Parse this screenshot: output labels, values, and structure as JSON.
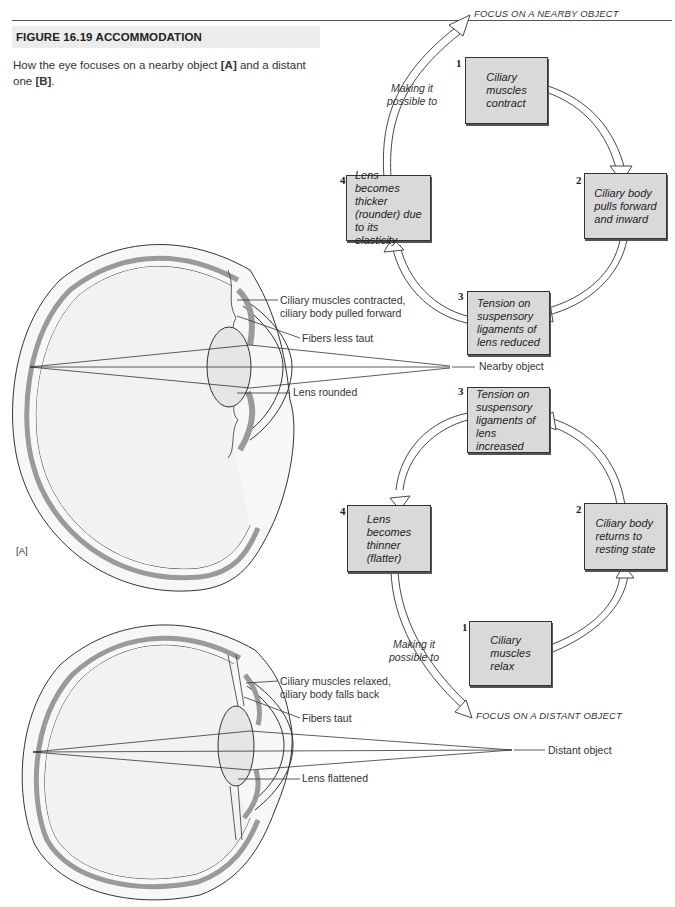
{
  "header": {
    "title": "FIGURE 16.19  ACCOMMODATION",
    "caption_pre": "How the eye focuses on a nearby object ",
    "caption_a": "[A]",
    "caption_mid": " and a distant one ",
    "caption_b": "[B]",
    "caption_post": "."
  },
  "panel_a": {
    "label": "[A]",
    "eye_labels": {
      "ciliary": "Ciliary muscles contracted,\n    ciliary body pulled forward",
      "fibers": "Fibers less taut",
      "lens": "Lens rounded",
      "object": "Nearby object"
    },
    "cycle": {
      "focus_label": "FOCUS ON A NEARBY OBJECT",
      "arrow_label": "Making it\npossible to",
      "steps": [
        {
          "num": "1",
          "text": "Ciliary\nmuscles\ncontract"
        },
        {
          "num": "2",
          "text": "Ciliary body\npulls forward\nand  inward"
        },
        {
          "num": "3",
          "text": "Tension on\nsuspensory\nligaments of\nlens reduced"
        },
        {
          "num": "4",
          "text": "Lens  becomes\nthicker\n(rounder)  due\nto its elasticity"
        }
      ]
    }
  },
  "panel_b": {
    "eye_labels": {
      "ciliary": "Ciliary muscles relaxed,\n    ciliary body falls back",
      "fibers": "Fibers taut",
      "lens": "Lens flattened",
      "object": "Distant object"
    },
    "cycle": {
      "focus_label": "FOCUS ON A DISTANT OBJECT",
      "arrow_label": "Making it\npossible to",
      "steps": [
        {
          "num": "1",
          "text": "Ciliary\nmuscles\nrelax"
        },
        {
          "num": "2",
          "text": "Ciliary body\nreturns to\nresting state"
        },
        {
          "num": "3",
          "text": "Tension on\nsuspensory\nligaments of\nlens increased"
        },
        {
          "num": "4",
          "text": "Lens\nbecomes\nthinner\n(flatter)"
        }
      ]
    }
  },
  "colors": {
    "box_fill": "#d9d9d9",
    "title_band": "#ececec",
    "tissue_gray": "#9a9a9a",
    "eye_fill": "#f4f4f4"
  }
}
